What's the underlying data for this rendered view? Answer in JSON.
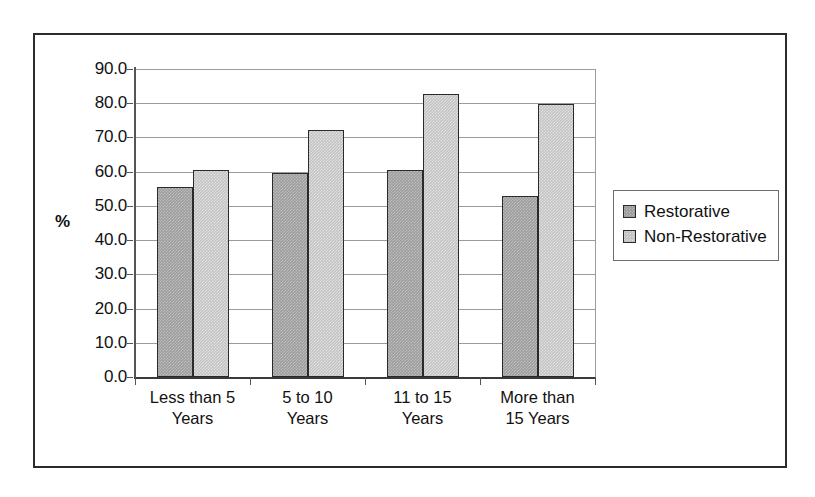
{
  "chart_data": {
    "type": "bar",
    "title": "",
    "subtitle": "",
    "xlabel": "",
    "ylabel": "%",
    "categories": [
      "Less than 5 Years",
      "5 to 10 Years",
      "11 to 15 Years",
      "More than 15 Years"
    ],
    "category_lines": [
      [
        "Less than 5",
        "Years"
      ],
      [
        "5 to 10",
        "Years"
      ],
      [
        "11 to 15",
        "Years"
      ],
      [
        "More than",
        "15 Years"
      ]
    ],
    "series": [
      {
        "name": "Restorative",
        "values": [
          55.5,
          59.6,
          60.4,
          53.0
        ],
        "color": "#9d9d9d"
      },
      {
        "name": "Non-Restorative",
        "values": [
          60.6,
          72.1,
          82.8,
          79.8
        ],
        "color": "#c3c3c3"
      }
    ],
    "ylim": [
      0.0,
      90.0
    ],
    "ytick_step": 10.0,
    "ytick_labels": [
      "90.0",
      "80.0",
      "70.0",
      "60.0",
      "50.0",
      "40.0",
      "30.0",
      "20.0",
      "10.0",
      "0.0"
    ],
    "ytick_values": [
      90.0,
      80.0,
      70.0,
      60.0,
      50.0,
      40.0,
      30.0,
      20.0,
      10.0,
      0.0
    ],
    "grid": true,
    "grid_axis": "y",
    "legend_position": "right",
    "legend_entries": [
      "Restorative",
      "Non-Restorative"
    ],
    "frame": true,
    "bar_border_color": "#2a2a2a",
    "gridline_color": "#9b9b9b",
    "axis_color": "#555555",
    "frame_color": "#2b2b2b"
  }
}
